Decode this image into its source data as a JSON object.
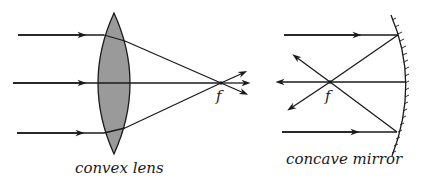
{
  "diagram": {
    "colors": {
      "line": "#1a1a1a",
      "lens_fill": "#9a9a9a",
      "background": "#ffffff"
    },
    "convex_lens": {
      "label": "convex lens",
      "focus_label": "f",
      "incoming_rays": 3,
      "outgoing_rays": 3
    },
    "concave_mirror": {
      "label": "concave mirror",
      "focus_label": "f",
      "incoming_rays": 3,
      "reflected_rays": 3
    }
  }
}
